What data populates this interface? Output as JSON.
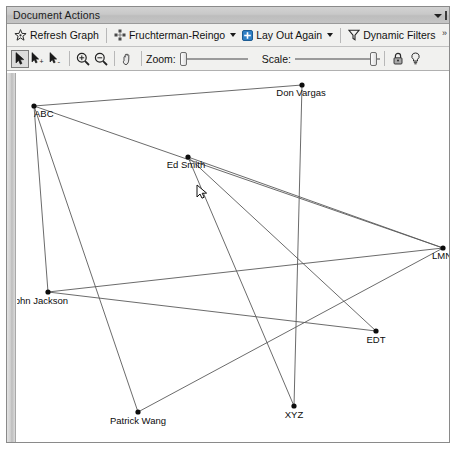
{
  "window": {
    "title": "Document Actions",
    "titlebar_icons": [
      "chevron-down-icon",
      "close-bar-icon"
    ]
  },
  "toolbar_row1": {
    "refresh_graph": {
      "label": "Refresh Graph",
      "icon": "star-graph-icon"
    },
    "layout_algorithm": {
      "label": "Fruchterman-Reingo",
      "icon": "layout-grid-icon",
      "dropdown": "chevron-down-icon"
    },
    "lay_out_again": {
      "label": "Lay Out Again",
      "icon": "layout-again-icon",
      "dropdown": "chevron-down-icon"
    },
    "dynamic_filters": {
      "label": "Dynamic Filters",
      "icon": "funnel-icon"
    },
    "overflow": {
      "label": "»"
    }
  },
  "toolbar_row2": {
    "select_tool": {
      "icon": "cursor-icon",
      "selected": true
    },
    "add_select_tool": {
      "icon": "cursor-plus-icon"
    },
    "remove_select_tool": {
      "icon": "cursor-minus-icon"
    },
    "zoom_in": {
      "icon": "magnifier-plus-icon"
    },
    "zoom_out": {
      "icon": "magnifier-minus-icon"
    },
    "pan": {
      "icon": "hand-icon"
    },
    "zoom_slider": {
      "label": "Zoom:",
      "value": 0
    },
    "scale_slider": {
      "label": "Scale:",
      "value": 96
    },
    "lock": {
      "icon": "lock-icon"
    },
    "bulb": {
      "icon": "lightbulb-icon"
    }
  },
  "graph_data": {
    "type": "node-link-graph",
    "layout": "Fruchterman-Reingold",
    "nodes": [
      {
        "id": "ABC",
        "label": "ABC",
        "x": 17,
        "y": 33,
        "label_dx": 0,
        "label_dy": 11,
        "anchor": "start"
      },
      {
        "id": "DonVargas",
        "label": "Don Vargas",
        "x": 285,
        "y": 12,
        "label_dx": -1,
        "label_dy": 11,
        "anchor": "middle"
      },
      {
        "id": "EdSmith",
        "label": "Ed Smith",
        "x": 171,
        "y": 84,
        "label_dx": -2,
        "label_dy": 11,
        "anchor": "middle"
      },
      {
        "id": "LMN",
        "label": "LMN",
        "x": 426,
        "y": 175,
        "label_dx": -1,
        "label_dy": 11,
        "anchor": "middle"
      },
      {
        "id": "JohnJackson",
        "label": "John Jackson",
        "x": 31,
        "y": 219,
        "label_dx": -9,
        "label_dy": 12,
        "anchor": "middle"
      },
      {
        "id": "EDT",
        "label": "EDT",
        "x": 359,
        "y": 258,
        "label_dx": 0,
        "label_dy": 12,
        "anchor": "middle"
      },
      {
        "id": "XYZ",
        "label": "XYZ",
        "x": 277,
        "y": 333,
        "label_dx": 0,
        "label_dy": 12,
        "anchor": "middle"
      },
      {
        "id": "PatrickWang",
        "label": "Patrick Wang",
        "x": 121,
        "y": 339,
        "label_dx": 0,
        "label_dy": 12,
        "anchor": "middle"
      }
    ],
    "edges": [
      {
        "source": "ABC",
        "target": "DonVargas"
      },
      {
        "source": "ABC",
        "target": "LMN"
      },
      {
        "source": "ABC",
        "target": "JohnJackson"
      },
      {
        "source": "ABC",
        "target": "PatrickWang"
      },
      {
        "source": "DonVargas",
        "target": "XYZ"
      },
      {
        "source": "EdSmith",
        "target": "XYZ"
      },
      {
        "source": "EdSmith",
        "target": "EDT"
      },
      {
        "source": "EdSmith",
        "target": "LMN"
      },
      {
        "source": "JohnJackson",
        "target": "LMN"
      },
      {
        "source": "JohnJackson",
        "target": "EDT"
      },
      {
        "source": "PatrickWang",
        "target": "LMN"
      }
    ],
    "cursor": {
      "x": 180,
      "y": 112,
      "type": "arrow-pointer"
    },
    "node_color": "#0d0d0d",
    "edge_color": "#5a5a5a",
    "background": "#ffffff"
  }
}
